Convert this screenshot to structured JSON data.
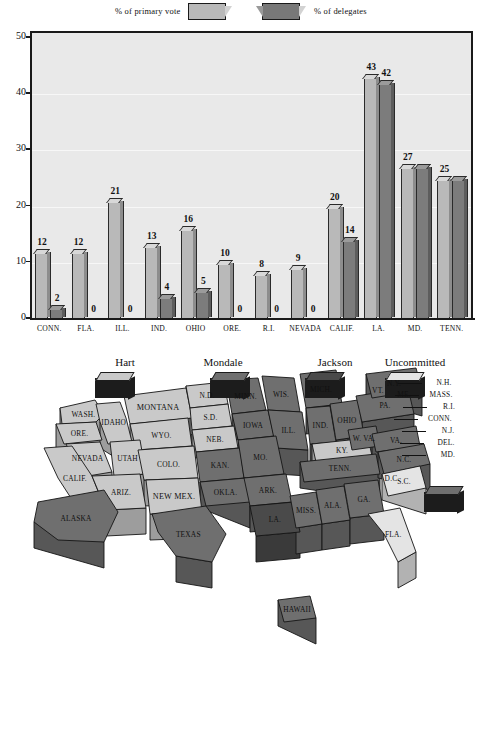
{
  "chart_legend": {
    "primary_label": "% of primary vote",
    "delegates_label": "% of delegates",
    "primary_color": "#b9b9b9",
    "delegates_color": "#787878"
  },
  "chart_data": {
    "type": "bar",
    "title": "",
    "xlabel": "",
    "ylabel": "",
    "ylim": [
      0,
      50
    ],
    "yticks": [
      "0",
      "10",
      "20",
      "30",
      "40",
      "50"
    ],
    "grid": true,
    "legend_position": "top",
    "categories": [
      "CONN.",
      "FLA.",
      "ILL.",
      "IND.",
      "OHIO",
      "ORE.",
      "R.I.",
      "NEVADA",
      "CALIF.",
      "LA.",
      "MD.",
      "TENN."
    ],
    "series": [
      {
        "name": "% of primary vote",
        "color": "#b9b9b9",
        "values": [
          12,
          12,
          21,
          13,
          16,
          10,
          8,
          9,
          20,
          43,
          27,
          25
        ]
      },
      {
        "name": "% of delegates",
        "color": "#787878",
        "values": [
          2,
          0,
          0,
          4,
          5,
          0,
          0,
          0,
          14,
          42,
          27,
          25
        ]
      }
    ],
    "primary_labels": [
      "12",
      "12",
      "21",
      "13",
      "16",
      "10",
      "8",
      "9",
      "20",
      "43",
      "27",
      "25"
    ],
    "delegate_labels": [
      "2",
      "0",
      "0",
      "4",
      "5",
      "0",
      "0",
      "0",
      "14",
      "42",
      "",
      ""
    ]
  },
  "map": {
    "headers": [
      {
        "label": "Hart",
        "key": "hart"
      },
      {
        "label": "Mondale",
        "key": "mondale"
      },
      {
        "label": "Jackson",
        "key": "jackson"
      },
      {
        "label": "Uncommitted",
        "key": "uncommitted"
      }
    ],
    "colors": {
      "hart": "#c9c9c9",
      "mondale": "#6f6f6f",
      "jackson": "#4a4a4a",
      "uncommitted": "#e4e4e4"
    },
    "states": [
      {
        "name": "WASH.",
        "winner": "hart"
      },
      {
        "name": "ORE.",
        "winner": "hart"
      },
      {
        "name": "IDAHO",
        "winner": "hart"
      },
      {
        "name": "MONTANA",
        "winner": "hart"
      },
      {
        "name": "N.D.",
        "winner": "hart"
      },
      {
        "name": "MINN.",
        "winner": "mondale"
      },
      {
        "name": "WIS.",
        "winner": "mondale"
      },
      {
        "name": "MICH.",
        "winner": "mondale"
      },
      {
        "name": "WYO.",
        "winner": "hart"
      },
      {
        "name": "S.D.",
        "winner": "hart"
      },
      {
        "name": "IOWA",
        "winner": "mondale"
      },
      {
        "name": "ILL.",
        "winner": "mondale"
      },
      {
        "name": "IND.",
        "winner": "mondale"
      },
      {
        "name": "OHIO",
        "winner": "mondale"
      },
      {
        "name": "PA.",
        "winner": "mondale"
      },
      {
        "name": "N.Y.",
        "winner": "mondale"
      },
      {
        "name": "NEVADA",
        "winner": "hart"
      },
      {
        "name": "UTAH",
        "winner": "hart"
      },
      {
        "name": "COLO.",
        "winner": "hart"
      },
      {
        "name": "NEB.",
        "winner": "hart"
      },
      {
        "name": "KAN.",
        "winner": "mondale"
      },
      {
        "name": "MO.",
        "winner": "mondale"
      },
      {
        "name": "KY.",
        "winner": "hart"
      },
      {
        "name": "W. VA.",
        "winner": "mondale"
      },
      {
        "name": "VA.",
        "winner": "mondale"
      },
      {
        "name": "CALIF.",
        "winner": "hart"
      },
      {
        "name": "ARIZ.",
        "winner": "hart"
      },
      {
        "name": "NEW MEX.",
        "winner": "hart"
      },
      {
        "name": "OKLA.",
        "winner": "mondale"
      },
      {
        "name": "ARK.",
        "winner": "mondale"
      },
      {
        "name": "TENN.",
        "winner": "mondale"
      },
      {
        "name": "N.C.",
        "winner": "mondale"
      },
      {
        "name": "S.C.",
        "winner": "uncommitted"
      },
      {
        "name": "TEXAS",
        "winner": "mondale"
      },
      {
        "name": "LA.",
        "winner": "jackson"
      },
      {
        "name": "MISS.",
        "winner": "mondale"
      },
      {
        "name": "ALA.",
        "winner": "mondale"
      },
      {
        "name": "GA.",
        "winner": "mondale"
      },
      {
        "name": "FLA.",
        "winner": "uncommitted"
      },
      {
        "name": "ALASKA",
        "winner": "mondale"
      },
      {
        "name": "HAWAII",
        "winner": "mondale"
      }
    ],
    "leader_labels": [
      "VT.",
      "ME.",
      "N.H.",
      "MASS.",
      "R.I.",
      "CONN.",
      "N.J.",
      "DEL.",
      "MD.",
      "D.C."
    ]
  },
  "territory_legend": [
    {
      "label": "American Samoa",
      "winner": "mondale"
    },
    {
      "label": "Democrats abroad",
      "winner": "uncommitted"
    },
    {
      "label": "Latin America",
      "winner": "uncommitted"
    },
    {
      "label": "Puerto Rico",
      "winner": "mondale"
    },
    {
      "label": "Virgin Islands",
      "winner": "mondale"
    },
    {
      "label": "Guam",
      "winner": "mondale"
    }
  ]
}
